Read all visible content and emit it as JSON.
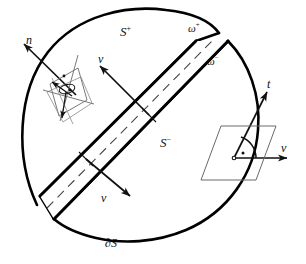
{
  "figure": {
    "colors": {
      "ink": "#111111",
      "outline": "#000000",
      "thin_line": "#555555",
      "background": "#ffffff"
    },
    "labels": {
      "normal": "n",
      "v_upper": "v",
      "v_lower": "v",
      "v_right": "v",
      "tangent": "t",
      "surface_plus": "S",
      "surface_plus_sup": "+",
      "surface_minus": "S",
      "surface_minus_sup": "−",
      "omega_plus": "ω",
      "omega_plus_sup": "+",
      "omega_minus": "ω",
      "omega_minus_sup": "−",
      "boundary": "∂S"
    },
    "icons": {
      "arrow_normal": "arrow-up-left-icon",
      "arrow_v_upper": "arrow-up-left-icon",
      "arrow_v_lower": "arrow-down-right-icon",
      "arrow_v_right": "arrow-right-icon",
      "arrow_tangent": "arrow-up-right-icon",
      "right_angle_marker": "right-angle-dot-icon",
      "angle_arc": "angle-arc-icon"
    }
  }
}
